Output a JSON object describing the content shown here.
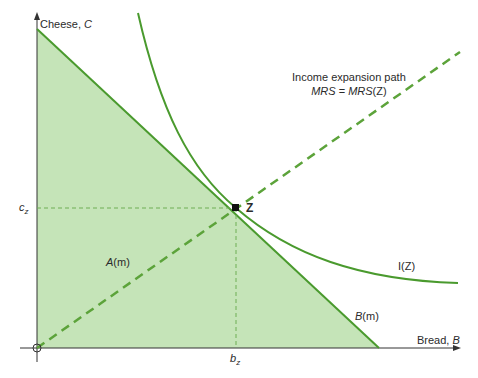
{
  "figure": {
    "y_axis_label": "Cheese, ",
    "y_axis_var": "C",
    "x_axis_label": "Bread, ",
    "x_axis_var": "B",
    "origin_label": "O",
    "point_label": "Z",
    "cz_main": "c",
    "cz_sub": "z",
    "bz_main": "b",
    "bz_sub": "z",
    "region_label_main": "A",
    "region_label_arg": "(m)",
    "budget_label_main": "B",
    "budget_label_arg": "(m)",
    "indiff_label": "I(Z)",
    "expansion_title": "Income expansion path",
    "expansion_eq_lhs": "MRS",
    "expansion_eq_mid": " = ",
    "expansion_eq_rhs": "MRS",
    "expansion_eq_arg": "(Z)"
  },
  "colors": {
    "fill": "#c5e4b8",
    "line": "#4a9a2e",
    "dash": "#5ca33a",
    "axis": "#333333",
    "guide": "#6fae55"
  }
}
